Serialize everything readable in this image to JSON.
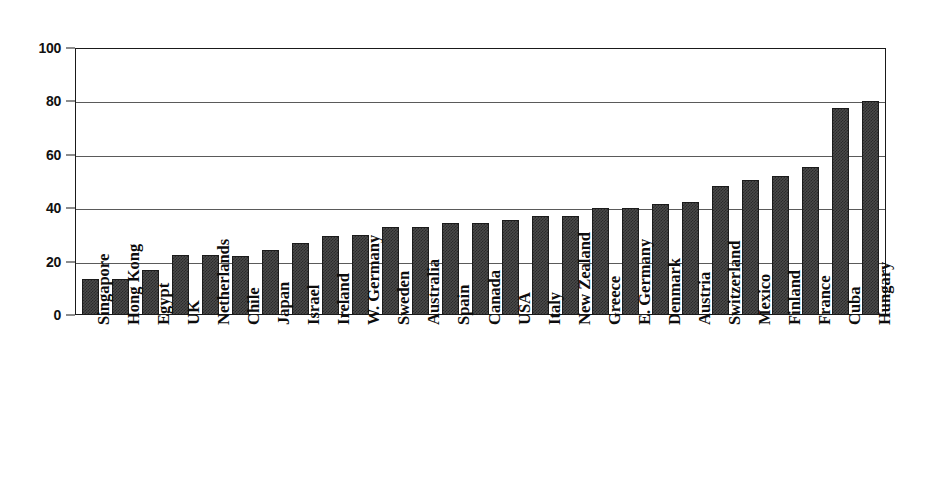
{
  "chart_data": {
    "type": "bar",
    "title": "",
    "subtitle": "",
    "xlabel": "",
    "ylabel": "",
    "ylim": [
      0,
      100
    ],
    "yticks": [
      0,
      20,
      40,
      60,
      80,
      100
    ],
    "grid": true,
    "legend": false,
    "legend_position": "none",
    "bar_color": "#3f3f3f",
    "bar_edge_color": "#1b1b1b",
    "axis_color": "#1a1a1a",
    "grid_color": "#5a5a5a",
    "background_color": "#ffffff",
    "categories": [
      "Singapore",
      "Hong Kong",
      "Egypt",
      "UK",
      "Netherlands",
      "Chile",
      "Japan",
      "Israel",
      "Ireland",
      "W. Germany",
      "Sweden",
      "Australia",
      "Spain",
      "Canada",
      "USA",
      "Italy",
      "New Zealand",
      "Greece",
      "E. Germany",
      "Denmark",
      "Austria",
      "Switzerland",
      "Mexico",
      "Finland",
      "France",
      "Cuba",
      "Hungary"
    ],
    "values": [
      13.5,
      13.5,
      17,
      22.5,
      22.5,
      22,
      24.5,
      27,
      29.5,
      30,
      33,
      33,
      34.5,
      34.5,
      35.5,
      37,
      37,
      40,
      40,
      41.5,
      42.5,
      48.5,
      50.5,
      52,
      55.5,
      77.5,
      80
    ]
  }
}
